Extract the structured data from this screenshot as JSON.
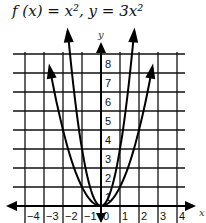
{
  "title": "f (x) = x², y = 3x²",
  "chart_data": {
    "type": "line",
    "title": "f (x) = x², y = 3x²",
    "xlabel": "x",
    "ylabel": "y",
    "xlim": [
      -4.5,
      4.5
    ],
    "ylim": [
      -0.9,
      8.5
    ],
    "grid": true,
    "x_ticks": [
      "-4",
      "-3",
      "-2",
      "-1",
      "0",
      "1",
      "2",
      "3",
      "4"
    ],
    "y_ticks": [
      "1",
      "2",
      "3",
      "4",
      "5",
      "6",
      "7",
      "8"
    ],
    "series": [
      {
        "name": "f(x) = x^2",
        "x": [
          -2.7,
          -2,
          -1,
          0,
          1,
          2,
          2.7
        ],
        "y": [
          7.29,
          4,
          1,
          0,
          1,
          4,
          7.29
        ]
      },
      {
        "name": "y = 3x^2",
        "x": [
          -1.75,
          -1,
          0,
          1,
          1.75
        ],
        "y": [
          9.19,
          3,
          0,
          3,
          9.19
        ]
      }
    ]
  }
}
